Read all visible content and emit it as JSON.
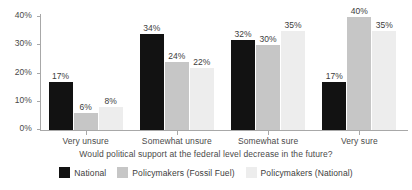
{
  "chart_data": {
    "type": "bar",
    "title": "",
    "xlabel": "Would political support at the federal level decrease in the future?",
    "ylabel": "",
    "ylim": [
      0,
      40
    ],
    "ytick_labels": [
      "0%",
      "10%",
      "20%",
      "30%",
      "40%"
    ],
    "ytick_values": [
      0,
      10,
      20,
      30,
      40
    ],
    "grid": false,
    "legend_position": "bottom",
    "categories": [
      "Very unsure",
      "Somewhat unsure",
      "Somewhat sure",
      "Very sure"
    ],
    "series": [
      {
        "name": "National",
        "color": "#121212",
        "values": [
          17,
          34,
          32,
          17
        ],
        "labels": [
          "17%",
          "34%",
          "32%",
          "17%"
        ]
      },
      {
        "name": "Policymakers (Fossil Fuel)",
        "color": "#c6c6c6",
        "values": [
          6,
          24,
          30,
          40
        ],
        "labels": [
          "6%",
          "24%",
          "30%",
          "40%"
        ]
      },
      {
        "name": "Policymakers (National)",
        "color": "#ededed",
        "values": [
          8,
          22,
          35,
          35
        ],
        "labels": [
          "8%",
          "22%",
          "35%",
          "35%"
        ]
      }
    ]
  }
}
